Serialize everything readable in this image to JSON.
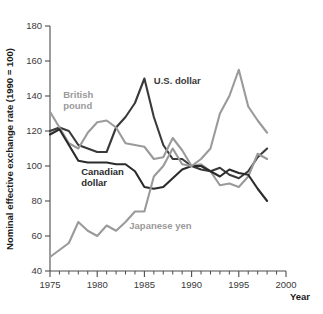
{
  "chart_data": {
    "type": "line",
    "title": "",
    "xlabel": "Year",
    "ylabel": "Nominal effective exchange rate (1990 = 100)",
    "xlim": [
      1975,
      2000
    ],
    "ylim": [
      40,
      180
    ],
    "xticks": [
      1975,
      1980,
      1985,
      1990,
      1995,
      2000
    ],
    "yticks": [
      40,
      60,
      80,
      100,
      120,
      140,
      160,
      180
    ],
    "xtick_labels": [
      "1975",
      "1980",
      "1985",
      "1990",
      "1995",
      "2000"
    ],
    "ytick_labels": [
      "40",
      "60",
      "80",
      "100",
      "120",
      "140",
      "160",
      "180"
    ],
    "x_minor_tick_step": 1,
    "grid": false,
    "legend": "inline-labels",
    "x": [
      1975,
      1976,
      1977,
      1978,
      1979,
      1980,
      1981,
      1982,
      1983,
      1984,
      1985,
      1986,
      1987,
      1988,
      1989,
      1990,
      1991,
      1992,
      1993,
      1994,
      1995,
      1996,
      1997,
      1998
    ],
    "series": [
      {
        "name": "U.S. dollar",
        "color": "#3a3a3a",
        "label_x": 1986.0,
        "label_y": 147,
        "values": [
          120,
          122,
          120,
          112,
          110,
          108,
          108,
          122,
          128,
          136,
          150,
          128,
          112,
          104,
          104,
          100,
          98,
          97,
          99,
          95,
          93,
          97,
          105,
          110
        ]
      },
      {
        "name": "British pound",
        "color": "#9a9a9a",
        "label_x": 1976.4,
        "label_y": 139,
        "values": [
          131,
          122,
          113,
          110,
          119,
          125,
          126,
          122,
          113,
          112,
          111,
          104,
          105,
          116,
          109,
          100,
          101,
          97,
          89,
          90,
          88,
          94,
          107,
          104
        ]
      },
      {
        "name": "Canadian dollar",
        "color": "#2b2b2b",
        "label_x": 1978.3,
        "label_y": 95,
        "values": [
          118,
          121,
          112,
          103,
          102,
          102,
          102,
          101,
          101,
          97,
          88,
          87,
          88,
          93,
          98,
          100,
          100,
          97,
          94,
          98,
          96,
          95,
          87,
          80
        ]
      },
      {
        "name": "Japanese yen",
        "color": "#9a9a9a",
        "label_x": 1983.4,
        "label_y": 64,
        "values": [
          48,
          52,
          56,
          68,
          63,
          60,
          66,
          63,
          68,
          74,
          74,
          94,
          100,
          110,
          101,
          100,
          104,
          110,
          130,
          140,
          155,
          134,
          126,
          119
        ]
      }
    ]
  }
}
